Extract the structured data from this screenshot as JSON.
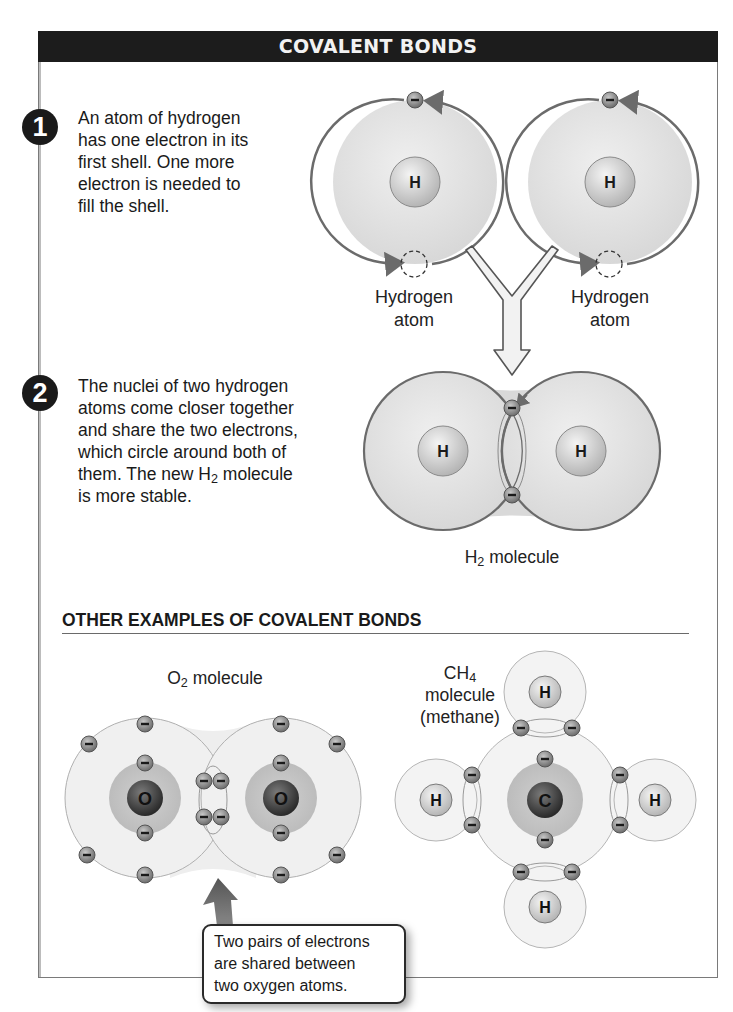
{
  "title": "COVALENT BONDS",
  "steps": [
    {
      "number": "1",
      "lines": [
        "An atom of hydrogen",
        "has one electron in its",
        "first shell. One more",
        "electron is needed to",
        "fill the shell."
      ]
    },
    {
      "number": "2",
      "lines": [
        "The nuclei of two hydrogen",
        "atoms come closer together",
        "and share the two electrons,",
        "which circle around both of"
      ],
      "line5_pre": "them. The new H",
      "line5_sub": "2",
      "line5_post": " molecule",
      "line6": "is more stable."
    }
  ],
  "hydrogen_atoms": [
    {
      "label_line1": "Hydrogen",
      "label_line2": "atom",
      "nucleus": "H"
    },
    {
      "label_line1": "Hydrogen",
      "label_line2": "atom",
      "nucleus": "H"
    }
  ],
  "h2_molecule": {
    "label_pre": "H",
    "label_sub": "2",
    "label_post": " molecule",
    "nuclei": [
      "H",
      "H"
    ]
  },
  "other_examples": {
    "heading": "OTHER EXAMPLES OF COVALENT BONDS",
    "o2": {
      "label_pre": "O",
      "label_sub": "2",
      "label_post": " molecule",
      "nuclei": [
        "O",
        "O"
      ]
    },
    "ch4": {
      "label_line1_pre": "CH",
      "label_line1_sub": "4",
      "label_line2": "molecule",
      "label_line3": "(methane)",
      "center": "C",
      "hydrogens": [
        "H",
        "H",
        "H",
        "H"
      ]
    },
    "callout": [
      "Two pairs of electrons",
      "are shared between",
      "two oxygen atoms."
    ]
  },
  "electron_symbol": "−",
  "colors": {
    "title_bar": "#1c1c1c",
    "shell_fill": "#e6e6e6",
    "shell_stroke": "#6b6b6b",
    "electron": "#8a8a8a",
    "nucleus_light": "#d4d4d4",
    "nucleus_dark": "#3a3a3a",
    "arrow": "#6f6f6f"
  }
}
